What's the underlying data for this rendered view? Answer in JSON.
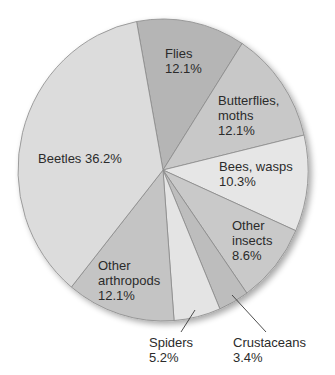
{
  "chart_data": {
    "type": "pie",
    "title": "",
    "start_angle_deg": -10.5,
    "direction": "clockwise",
    "center": [
      163,
      170
    ],
    "radius": [
      145,
      151
    ],
    "slices": [
      {
        "name": "Flies",
        "value": 12.1,
        "label_line1": "Flies",
        "label_line2": "12.1%",
        "color": "#b5b5b5"
      },
      {
        "name": "Butterflies, moths",
        "value": 12.1,
        "label_line1": "Butterflies,",
        "label_line2": "moths",
        "label_line3": "12.1%",
        "color": "#c8c8c8"
      },
      {
        "name": "Bees, wasps",
        "value": 10.3,
        "label_line1": "Bees, wasps",
        "label_line2": "10.3%",
        "color": "#e6e6e6"
      },
      {
        "name": "Other insects",
        "value": 8.6,
        "label_line1": "Other",
        "label_line2": "insects",
        "label_line3": "8.6%",
        "color": "#c9c9c9"
      },
      {
        "name": "Crustaceans",
        "value": 3.4,
        "label_line1": "Crustaceans",
        "label_line2": "3.4%",
        "color": "#bdbdbd"
      },
      {
        "name": "Spiders",
        "value": 5.2,
        "label_line1": "Spiders",
        "label_line2": "5.2%",
        "color": "#e4e4e4"
      },
      {
        "name": "Other arthropods",
        "value": 12.1,
        "label_line1": "Other",
        "label_line2": "arthropods",
        "label_line3": "12.1%",
        "color": "#c4c4c4"
      },
      {
        "name": "Beetles",
        "value": 36.2,
        "label_line1": "Beetles 36.2%",
        "color": "#dcdcdc"
      }
    ],
    "legend": "none",
    "grid": false
  }
}
